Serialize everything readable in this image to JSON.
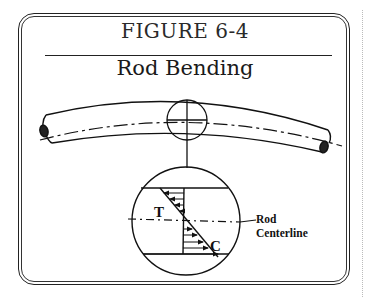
{
  "figure": {
    "number": "FIGURE 6-4",
    "title": "Rod Bending"
  },
  "diagram": {
    "labels": {
      "tension": "T",
      "compression": "C",
      "centerline_line1": "Rod",
      "centerline_line2": "Centerline"
    },
    "elements": [
      "bent-rod",
      "rod-centerline-dash-dot",
      "detail-circle-small",
      "leader-line",
      "detail-circle-magnified",
      "stress-distribution-triangles",
      "force-arrows"
    ]
  },
  "colors": {
    "ink": "#111111",
    "background": "#ffffff"
  }
}
